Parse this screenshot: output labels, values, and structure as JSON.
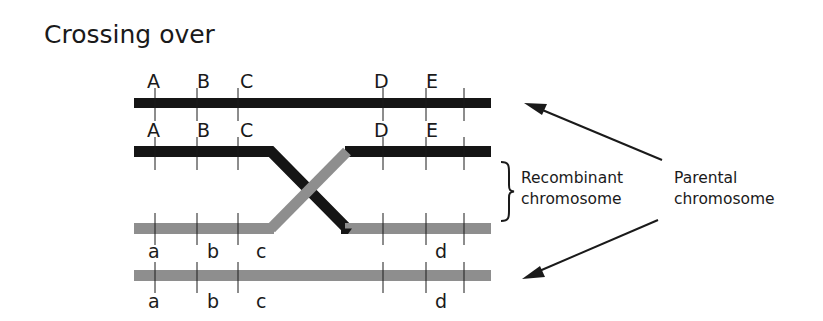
{
  "title": "Crossing over",
  "colors": {
    "dark_chromosome": "#151515",
    "light_chromosome": "#8e8e8e",
    "text": "#1a1a1a",
    "arrow": "#1a1a1a"
  },
  "chromosomes": [
    {
      "id": "parental-dark",
      "shade": "dark",
      "kind": "parental",
      "labels_above": [
        "A",
        "B",
        "C",
        "D",
        "E"
      ]
    },
    {
      "id": "recombinant-dark-to-light",
      "shade": "dark-then-light",
      "kind": "recombinant",
      "labels_above": [
        "A",
        "B",
        "C",
        "D",
        "E"
      ]
    },
    {
      "id": "recombinant-light-to-dark",
      "shade": "light-then-dark",
      "kind": "recombinant",
      "labels_below": [
        "a",
        "b",
        "c",
        "d"
      ]
    },
    {
      "id": "parental-light",
      "shade": "light",
      "kind": "parental",
      "labels_below": [
        "a",
        "b",
        "c",
        "d"
      ]
    }
  ],
  "annotations": {
    "recombinant_line1": "Recombinant",
    "recombinant_line2": "chromosome",
    "parental_line1": "Parental",
    "parental_line2": "chromosome"
  }
}
